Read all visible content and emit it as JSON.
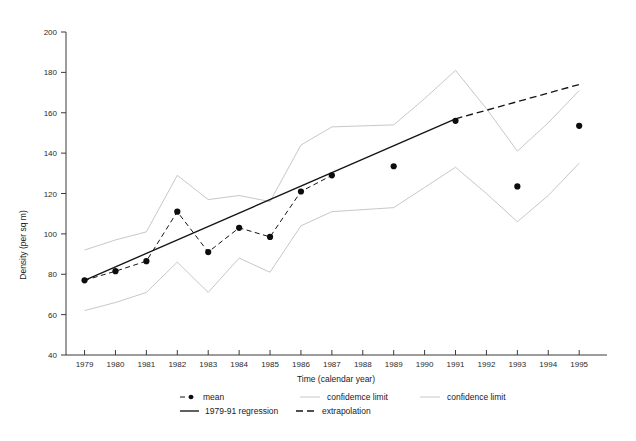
{
  "chart_data": {
    "type": "line",
    "title": "",
    "xlabel": "Time (calendar year)",
    "ylabel": "Density (per sq m)",
    "xlim": [
      1978.4,
      1995.9
    ],
    "ylim": [
      40,
      200
    ],
    "ytick_step": 20,
    "grid": false,
    "legend_position": "bottom",
    "x": [
      1979,
      1980,
      1981,
      1982,
      1983,
      1984,
      1985,
      1986,
      1987,
      1988,
      1989,
      1990,
      1991,
      1992,
      1993,
      1994,
      1995
    ],
    "xticklabels": [
      "1979",
      "1980",
      "1981",
      "1982",
      "1983",
      "1984",
      "1985",
      "1986",
      "1987",
      "1988",
      "1989",
      "1990",
      "1991",
      "1992",
      "1993",
      "1994",
      "1995"
    ],
    "yticklabels": [
      "40",
      "60",
      "80",
      "100",
      "120",
      "140",
      "160",
      "180",
      "200"
    ],
    "yticks": [
      40,
      60,
      80,
      100,
      120,
      140,
      160,
      180,
      200
    ],
    "series": [
      {
        "name": "mean",
        "style": "dashed-line-with-filled-circle-markers",
        "x": [
          1979,
          1980,
          1981,
          1982,
          1983,
          1984,
          1985,
          1986,
          1987,
          1989,
          1991,
          1993,
          1995
        ],
        "values": [
          77,
          81.5,
          86.5,
          111,
          91,
          103,
          98.5,
          121,
          129,
          133.5,
          156,
          123.5,
          153.5
        ],
        "connected_x": [
          1979,
          1980,
          1981,
          1982,
          1983,
          1984,
          1985,
          1986,
          1987
        ],
        "connected_values": [
          77,
          81.5,
          86.5,
          111,
          91,
          103,
          98.5,
          121,
          129
        ]
      },
      {
        "name": "confidemce limit",
        "style": "thin-grey-line-upper",
        "x": [
          1979,
          1980,
          1981,
          1982,
          1983,
          1984,
          1985,
          1986,
          1987,
          1988,
          1989,
          1990,
          1991,
          1992,
          1993,
          1994,
          1995
        ],
        "values": [
          92,
          97,
          101,
          129,
          117,
          119,
          116,
          144,
          153,
          153.5,
          154,
          167,
          181,
          162,
          141,
          155,
          171
        ]
      },
      {
        "name": "confidence limit",
        "style": "thin-grey-line-lower",
        "x": [
          1979,
          1980,
          1981,
          1982,
          1983,
          1984,
          1985,
          1986,
          1987,
          1988,
          1989,
          1990,
          1991,
          1992,
          1993,
          1994,
          1995
        ],
        "values": [
          62,
          66,
          71,
          86,
          71,
          88,
          81,
          104,
          111,
          112,
          113,
          123,
          133,
          120,
          106,
          119,
          135
        ]
      },
      {
        "name": "1979-91 regression",
        "style": "solid-black-line",
        "x": [
          1979,
          1991
        ],
        "values": [
          77,
          157
        ]
      },
      {
        "name": "extrapolation",
        "style": "dashed-black-line",
        "x": [
          1991,
          1995
        ],
        "values": [
          157,
          174
        ]
      }
    ]
  },
  "legend": {
    "entries": [
      {
        "label": "mean",
        "marker": "dashed-line-dot"
      },
      {
        "label": "confidemce limit",
        "marker": "thin-grey-line"
      },
      {
        "label": "confidence limit",
        "marker": "thin-grey-line"
      },
      {
        "label": "1979-91 regression",
        "marker": "solid-black-line"
      },
      {
        "label": "extrapolation",
        "marker": "dashed-black-line"
      }
    ]
  },
  "colors": {
    "axis": "#3a3a3a",
    "mean": "#0d0d0d",
    "confidence_limit": "#b9b9b9",
    "regression": "#141414",
    "extrapolation": "#141414",
    "background": "#ffffff"
  }
}
